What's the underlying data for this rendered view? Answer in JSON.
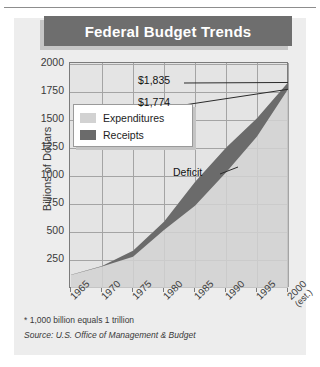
{
  "card": {
    "title": "Federal Budget Trends"
  },
  "footnotes": {
    "unit_note": "* 1,000 billion equals 1 trillion",
    "source": "Source: U.S. Office of Management & Budget"
  },
  "chart_data": {
    "type": "area",
    "title": "Federal Budget Trends",
    "xlabel": "",
    "ylabel": "Billions of Dollars",
    "xlim": [
      1965,
      2000
    ],
    "ylim": [
      0,
      2000
    ],
    "grid": true,
    "legend_position": "upper-left-inside",
    "categories": [
      "1965",
      "1970",
      "1975",
      "1980",
      "1985",
      "1990",
      "1995",
      "2000"
    ],
    "x_tick_labels": [
      "1965",
      "1970",
      "1975",
      "1980",
      "1985",
      "1990",
      "1995",
      "2000"
    ],
    "x_tick_sublabel_last": "(est.)",
    "y_tick_labels": [
      "250",
      "500",
      "750",
      "1000",
      "1250",
      "1500",
      "1750",
      "2000"
    ],
    "y_ticks": [
      250,
      500,
      750,
      1000,
      1250,
      1500,
      1750,
      2000
    ],
    "series": [
      {
        "name": "Expenditures",
        "color": "#d2d2d2",
        "values": [
          118,
          196,
          332,
          591,
          946,
          1253,
          1516,
          1835
        ]
      },
      {
        "name": "Receipts",
        "color": "#6b6b6b",
        "values": [
          117,
          193,
          279,
          517,
          734,
          1032,
          1352,
          1774
        ]
      }
    ],
    "fill_between_label": "Deficit",
    "annotations": [
      {
        "name": "expenditures-2000-value",
        "text": "$1,835",
        "series": "Expenditures",
        "x": "2000",
        "value": 1835
      },
      {
        "name": "receipts-2000-value",
        "text": "$1,774",
        "series": "Receipts",
        "x": "2000",
        "value": 1774
      },
      {
        "name": "deficit-callout",
        "text": "Deficit"
      }
    ],
    "colors": {
      "expenditures": "#d2d2d2",
      "receipts": "#6b6b6b",
      "plot_background": "#e4e4e4",
      "grid": "#a4a4a4",
      "title_bar": "#6e6e6e",
      "card_background": "#ededed"
    }
  },
  "legend": {
    "items": [
      {
        "label": "Expenditures",
        "color": "#d2d2d2"
      },
      {
        "label": "Receipts",
        "color": "#6b6b6b"
      }
    ]
  },
  "labels": {
    "expenditures_value": "$1,835",
    "receipts_value": "$1,774",
    "deficit": "Deficit"
  }
}
